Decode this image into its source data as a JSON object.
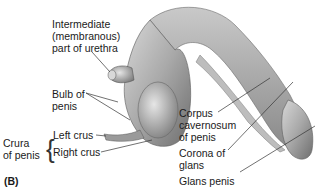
{
  "figure": {
    "panel_label": "(B)",
    "labels": {
      "urethra": [
        "Intermediate",
        "(membranous)",
        "part of urethra"
      ],
      "bulb": [
        "Bulb of",
        "penis"
      ],
      "crura_group": [
        "Crura",
        "of penis"
      ],
      "left_crus": "Left crus",
      "right_crus": "Right crus",
      "corpus": [
        "Corpus",
        "cavernosum",
        "of penis"
      ],
      "corona": [
        "Corona of",
        "glans"
      ],
      "glans": "Glans penis"
    }
  }
}
